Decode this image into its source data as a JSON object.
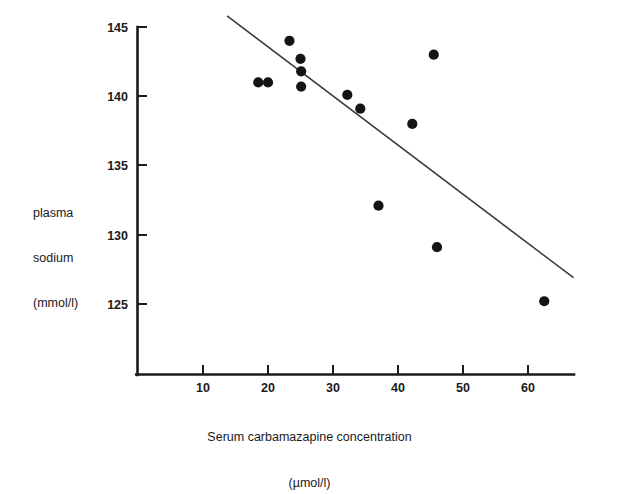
{
  "chart_data": {
    "type": "scatter",
    "title": "",
    "xlabel": "Serum carbamazapine concentration",
    "xlabel_units": "(µmol/l)",
    "ylabel_lines": [
      "plasma",
      "sodium",
      "(mmol/l)"
    ],
    "xlabel_full": "Serum carbamazapine concentration (µmol/l)",
    "ylabel_full": "plasma sodium (mmol/l)",
    "xlim": [
      0,
      68
    ],
    "ylim": [
      123,
      146
    ],
    "xticks": [
      10,
      20,
      30,
      40,
      50,
      60
    ],
    "xtick_labels": [
      "10",
      "20",
      "30",
      "40",
      "50",
      "60"
    ],
    "yticks": [
      125,
      130,
      135,
      140,
      145
    ],
    "ytick_labels": [
      "125",
      "130",
      "135",
      "140",
      "145"
    ],
    "grid": false,
    "legend": false,
    "marker": "filled-circle",
    "marker_color": "#141414",
    "line_color": "#3a3a3a",
    "points": [
      {
        "x": 18.5,
        "y": 141.0
      },
      {
        "x": 20.0,
        "y": 141.0
      },
      {
        "x": 23.3,
        "y": 144.0
      },
      {
        "x": 25.0,
        "y": 142.7
      },
      {
        "x": 25.1,
        "y": 141.8
      },
      {
        "x": 25.1,
        "y": 140.7
      },
      {
        "x": 32.2,
        "y": 140.1
      },
      {
        "x": 34.2,
        "y": 139.1
      },
      {
        "x": 42.2,
        "y": 138.0
      },
      {
        "x": 37.0,
        "y": 132.1
      },
      {
        "x": 45.5,
        "y": 143.0
      },
      {
        "x": 46.0,
        "y": 129.1
      },
      {
        "x": 62.5,
        "y": 125.2
      }
    ],
    "fit_line": {
      "name": "regression-line",
      "x_start": 13.7,
      "y_start": 145.8,
      "x_end": 67.0,
      "y_end": 126.9
    }
  }
}
